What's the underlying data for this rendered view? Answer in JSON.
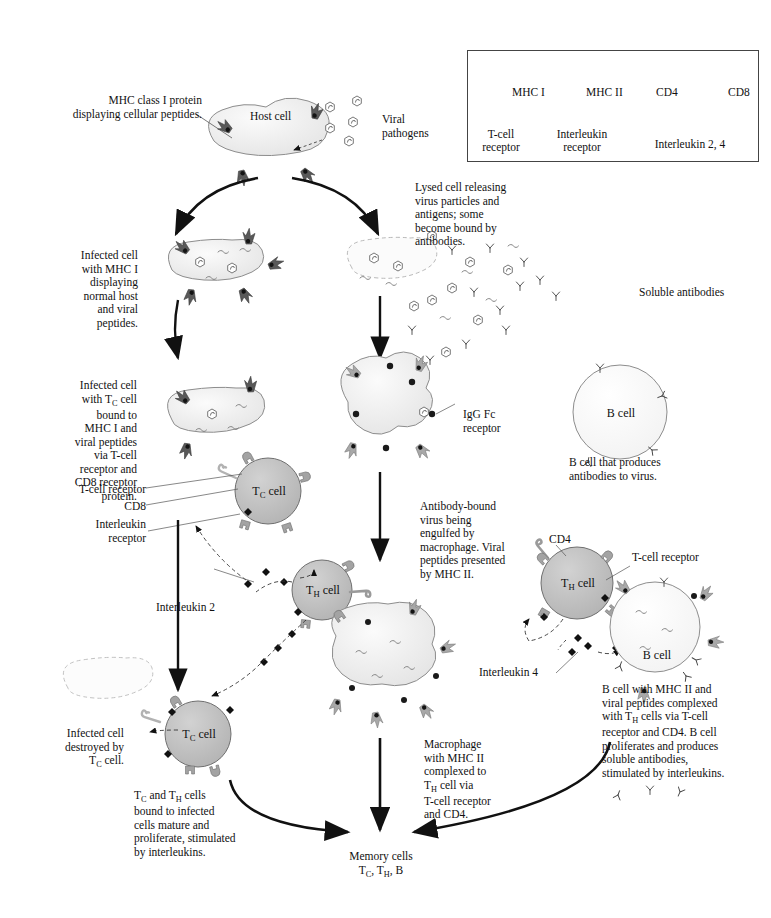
{
  "figure": {
    "domain": "biology-immunology-diagram",
    "title_visible": false
  },
  "legend": {
    "items": [
      {
        "key": "mhc1",
        "label": "MHC I",
        "icon": "mhc-class-1-icon",
        "color": "#595959"
      },
      {
        "key": "mhc2",
        "label": "MHC II",
        "icon": "mhc-class-2-icon",
        "color": "#a8a8a8"
      },
      {
        "key": "cd4",
        "label": "CD4",
        "icon": "cd4-icon",
        "color": "#9a9a9a"
      },
      {
        "key": "cd8",
        "label": "CD8",
        "icon": "cd8-icon",
        "color": "#b5b5b5"
      },
      {
        "key": "tcr",
        "label": "T-cell\nreceptor",
        "label_line1": "T-cell",
        "label_line2": "receptor",
        "icon": "t-cell-receptor-icon",
        "color": "#a0a0a0"
      },
      {
        "key": "ilr",
        "label": "Interleukin\nreceptor",
        "label_line1": "Interleukin",
        "label_line2": "receptor",
        "icon": "interleukin-receptor-icon",
        "color": "#a0a0a0"
      },
      {
        "key": "il",
        "label": "Interleukin 2, 4",
        "icon": "interleukin-molecule-icon",
        "color": "#111111"
      }
    ]
  },
  "labels": {
    "mhc1_callout": "MHC class I protein\ndisplaying cellular peptides.",
    "mhc1_callout_l1": "MHC class I protein",
    "mhc1_callout_l2": "displaying cellular peptides.",
    "host_cell": "Host cell",
    "viral_pathogens_l1": "Viral",
    "viral_pathogens_l2": "pathogens",
    "infected_cell_mhc1_l1": "Infected cell",
    "infected_cell_mhc1_l2": "with MHC I",
    "infected_cell_mhc1_l3": "displaying",
    "infected_cell_mhc1_l4": "normal host",
    "infected_cell_mhc1_l5": "and viral",
    "infected_cell_mhc1_l6": "peptides.",
    "lysed_cell_l1": "Lysed cell releasing",
    "lysed_cell_l2": "virus particles and",
    "lysed_cell_l3": "antigens; some",
    "lysed_cell_l4": "become bound by",
    "lysed_cell_l5": "antibodies.",
    "soluble_antibodies": "Soluble antibodies",
    "infected_tc_l1": "Infected cell",
    "infected_tc_l2": "with T_C cell",
    "infected_tc_l3": "bound to",
    "infected_tc_l4": "MHC I and",
    "infected_tc_l5": "viral peptides",
    "infected_tc_l6": "via T-cell",
    "infected_tc_l7": "receptor and",
    "infected_tc_l8": "CD8 receptor",
    "infected_tc_l9": "protein.",
    "t_cell_receptor": "T-cell receptor",
    "cd8": "CD8",
    "interleukin_receptor_l1": "Interleukin",
    "interleukin_receptor_l2": "receptor",
    "tc_cell": "T_C cell",
    "th_cell": "T_H cell",
    "b_cell": "B cell",
    "igg_fc_l1": "IgG Fc",
    "igg_fc_l2": "receptor",
    "b_cell_produces_l1": "B cell that produces",
    "b_cell_produces_l2": "antibodies to virus.",
    "antibody_bound_l1": "Antibody-bound",
    "antibody_bound_l2": "virus being",
    "antibody_bound_l3": "engulfed by",
    "antibody_bound_l4": "macrophage. Viral",
    "antibody_bound_l5": "peptides presented",
    "antibody_bound_l6": "by MHC II.",
    "interleukin_2": "Interleukin 2",
    "interleukin_4": "Interleukin 4",
    "cd4": "CD4",
    "t_cell_receptor_right": "T-cell receptor",
    "bcell_mhc2_l1": "B cell with MHC II and",
    "bcell_mhc2_l2": "viral peptides complexed",
    "bcell_mhc2_l3": "with T_H cells via T-cell",
    "bcell_mhc2_l4": "receptor and CD4.  B cell",
    "bcell_mhc2_l5": "proliferates and produces",
    "bcell_mhc2_l6": "soluble antibodies,",
    "bcell_mhc2_l7": "stimulated by interleukins.",
    "infected_destroyed_l1": "Infected cell",
    "infected_destroyed_l2": "destroyed by",
    "infected_destroyed_l3": "T_C cell.",
    "tc_th_mature_l1": "T_C and T_H cells",
    "tc_th_mature_l2": "bound to infected",
    "tc_th_mature_l3": "cells mature and",
    "tc_th_mature_l4": "proliferate, stimulated",
    "tc_th_mature_l5": "by interleukins.",
    "macrophage_l1": "Macrophage",
    "macrophage_l2": "with MHC II",
    "macrophage_l3": "complexed to",
    "macrophage_l4": "T_H cell via",
    "macrophage_l5": "T-cell receptor",
    "macrophage_l6": "and CD4.",
    "memory_cells_l1": "Memory cells",
    "memory_cells_l2": "T_C, T_H, B"
  },
  "colors": {
    "mhc1": "#595959",
    "mhc2": "#a8a8a8",
    "cell_fill": "#f0f0f0",
    "tcell_fill": "#bfbfbf",
    "bcell_fill": "#fafafa",
    "receptor": "#a0a0a0",
    "outline": "#333333",
    "interleukin": "#111111",
    "background": "#ffffff"
  }
}
